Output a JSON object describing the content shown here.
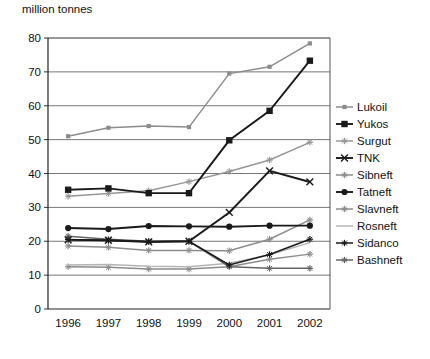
{
  "chart_data": {
    "type": "line",
    "title": "",
    "ylabel": "million tonnes",
    "xlabel": "",
    "categories": [
      "1996",
      "1997",
      "1998",
      "1999",
      "2000",
      "2001",
      "2002"
    ],
    "ylim": [
      0,
      80
    ],
    "yticks": [
      0,
      10,
      20,
      30,
      40,
      50,
      60,
      70,
      80
    ],
    "grid": true,
    "legend_position": "right",
    "series": [
      {
        "name": "Lukoil",
        "values": [
          51.0,
          53.5,
          54.0,
          53.7,
          69.5,
          71.5,
          78.4
        ],
        "color": "#8c8c8c",
        "marker": "square-small"
      },
      {
        "name": "Yukos",
        "values": [
          35.2,
          35.6,
          34.2,
          34.2,
          49.8,
          58.5,
          73.3
        ],
        "color": "#1a1a1a",
        "marker": "square"
      },
      {
        "name": "Surgut",
        "values": [
          33.3,
          34.1,
          34.9,
          37.6,
          40.6,
          44.0,
          49.2
        ],
        "color": "#969696",
        "marker": "star"
      },
      {
        "name": "TNK",
        "values": [
          20.4,
          20.3,
          19.8,
          20.0,
          28.5,
          40.8,
          37.5
        ],
        "color": "#1a1a1a",
        "marker": "cross"
      },
      {
        "name": "Sibneft",
        "values": [
          18.6,
          18.2,
          17.3,
          17.3,
          17.2,
          20.6,
          26.3
        ],
        "color": "#8c8c8c",
        "marker": "star"
      },
      {
        "name": "Tatneft",
        "values": [
          23.9,
          23.6,
          24.5,
          24.4,
          24.3,
          24.6,
          24.6
        ],
        "color": "#1a1a1a",
        "marker": "circle"
      },
      {
        "name": "Slavneft",
        "values": [
          12.5,
          12.3,
          11.8,
          11.8,
          12.5,
          14.7,
          16.2
        ],
        "color": "#8c8c8c",
        "marker": "star"
      },
      {
        "name": "Rosneft",
        "values": [
          13.0,
          13.1,
          12.6,
          12.5,
          13.5,
          16.0,
          19.6
        ],
        "color": "#b4b4b4",
        "marker": "none"
      },
      {
        "name": "Sidanco",
        "values": [
          20.5,
          20.2,
          19.9,
          20.0,
          13.0,
          16.1,
          20.6
        ],
        "color": "#1a1a1a",
        "marker": "star"
      },
      {
        "name": "Bashneft",
        "values": [
          21.5,
          20.6,
          20.0,
          20.0,
          12.5,
          12.0,
          12.0
        ],
        "color": "#646464",
        "marker": "star"
      }
    ]
  },
  "legend": {
    "items": [
      {
        "label": "Lukoil"
      },
      {
        "label": "Yukos"
      },
      {
        "label": "Surgut"
      },
      {
        "label": "TNK"
      },
      {
        "label": "Sibneft"
      },
      {
        "label": "Tatneft"
      },
      {
        "label": "Slavneft"
      },
      {
        "label": "Rosneft"
      },
      {
        "label": "Sidanco"
      },
      {
        "label": "Bashneft"
      }
    ]
  }
}
